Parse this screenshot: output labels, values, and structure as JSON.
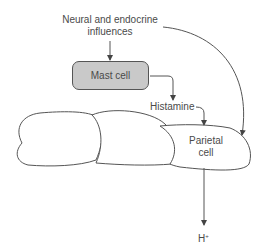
{
  "diagram": {
    "nodes": {
      "influences": {
        "label_line1": "Neural and endocrine",
        "label_line2": "influences"
      },
      "mast_cell": {
        "label": "Mast cell",
        "fill": "#c9c9c9"
      },
      "histamine": {
        "label": "Histamine"
      },
      "parietal_cell": {
        "label_line1": "Parietal",
        "label_line2": "cell"
      },
      "output": {
        "label": "H",
        "superscript": "+"
      }
    },
    "edges": [
      {
        "from": "influences",
        "to": "mast_cell"
      },
      {
        "from": "mast_cell",
        "to": "histamine"
      },
      {
        "from": "histamine",
        "to": "parietal_cell"
      },
      {
        "from": "influences",
        "to": "parietal_cell"
      },
      {
        "from": "parietal_cell",
        "to": "output"
      }
    ],
    "colors": {
      "line": "#555555",
      "text": "#4a4a4a",
      "background": "#ffffff"
    }
  }
}
